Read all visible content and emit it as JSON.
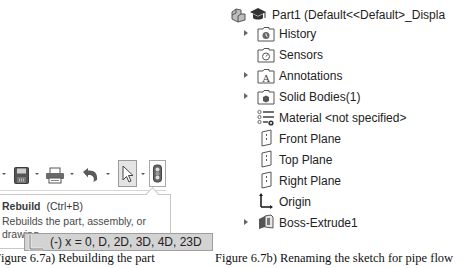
{
  "figure_a": {
    "toolbar": {
      "items": [
        {
          "name": "save",
          "icon": "save-icon"
        },
        {
          "name": "print",
          "icon": "print-icon"
        },
        {
          "name": "undo",
          "icon": "undo-icon"
        },
        {
          "name": "select",
          "icon": "cursor-arrow-icon"
        },
        {
          "name": "rebuild",
          "icon": "traffic-light-rebuild-icon"
        }
      ]
    },
    "tooltip": {
      "title": "Rebuild",
      "shortcut": "(Ctrl+B)",
      "description": "Rebuilds the part, assembly, or drawing."
    },
    "caption": "Figure 6.7a) Rebuilding the part"
  },
  "figure_b": {
    "tree": {
      "root": {
        "label": "Part1  (Default<<Default>_Displa",
        "icons": [
          "part-icon",
          "graduation-cap-icon"
        ]
      },
      "items": [
        {
          "label": "History",
          "icon": "history-folder-icon",
          "expandable": true
        },
        {
          "label": "Sensors",
          "icon": "sensors-folder-icon",
          "expandable": false
        },
        {
          "label": "Annotations",
          "icon": "annotations-folder-icon",
          "expandable": true
        },
        {
          "label": "Solid Bodies(1)",
          "icon": "solid-bodies-folder-icon",
          "expandable": true
        },
        {
          "label": "Material <not specified>",
          "icon": "material-icon",
          "expandable": false
        },
        {
          "label": "Front Plane",
          "icon": "plane-icon",
          "expandable": false
        },
        {
          "label": "Top Plane",
          "icon": "plane-icon",
          "expandable": false
        },
        {
          "label": "Right Plane",
          "icon": "plane-icon",
          "expandable": false
        },
        {
          "label": "Origin",
          "icon": "origin-icon",
          "expandable": false
        },
        {
          "label": "Boss-Extrude1",
          "icon": "extrude-feature-icon",
          "expandable": true
        },
        {
          "label": "(-) x = 0, D, 2D, 3D, 4D, 23D",
          "icon": "sketch-icon",
          "expandable": false,
          "selected": true
        }
      ]
    },
    "caption": "Figure 6.7b) Renaming the sketch for pipe flow"
  },
  "colors": {
    "selection_bg": "#d3d3d3",
    "selection_border": "#9e9e9e",
    "tooltip_border": "#c8c8c8"
  }
}
